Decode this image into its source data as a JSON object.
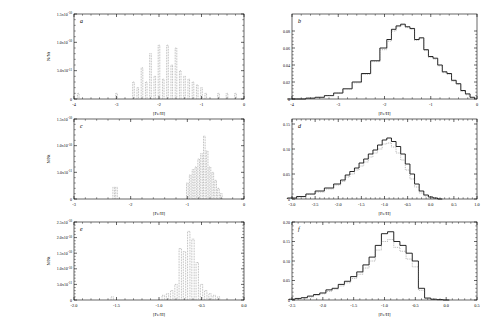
{
  "figure": {
    "background": "#ffffff",
    "axis_color": "#000000",
    "hist_color_solid": "#000000",
    "hist_color_dotted": "#666666",
    "panels": [
      "a",
      "b",
      "c",
      "d",
      "e",
      "f"
    ]
  },
  "chart_data": [
    {
      "type": "bar",
      "panel_label": "a",
      "title": "",
      "xlabel": "[Fe/H]",
      "ylabel": "N/Nt",
      "xlim": [
        -4,
        0
      ],
      "ylim": [
        0,
        1.5e-10
      ],
      "xticks": [
        -4,
        -3,
        -2,
        -1,
        0
      ],
      "xtick_labels": [
        "-4",
        "-3",
        "-2",
        "-1",
        "0"
      ],
      "yticks": [
        0,
        5e-11,
        1e-10,
        1.5e-10
      ],
      "ytick_labels": [
        "0",
        "5.0x10^-11",
        "1.0x10^-10",
        "1.5x10^-10"
      ],
      "grid": false,
      "legend": null,
      "linestyle": "dotted",
      "x": [
        -3.9,
        -3.0,
        -2.6,
        -2.5,
        -2.4,
        -2.3,
        -2.2,
        -2.1,
        -2.0,
        -1.9,
        -1.8,
        -1.7,
        -1.6,
        -1.5,
        -1.4,
        -1.3,
        -1.2,
        -1.1,
        -1.0,
        -0.9,
        -0.6,
        -0.4,
        -0.2
      ],
      "values": [
        1e-11,
        1e-11,
        3e-11,
        2e-11,
        5.5e-11,
        3e-11,
        8e-11,
        4e-11,
        9.5e-11,
        3.5e-11,
        9.5e-11,
        6e-11,
        9e-11,
        5e-11,
        4e-11,
        3.5e-11,
        3e-11,
        2.5e-11,
        2e-11,
        1e-11,
        1e-11,
        1e-11,
        1e-11
      ]
    },
    {
      "type": "line",
      "panel_label": "b",
      "title": "",
      "xlabel": "[Fe/H]",
      "ylabel": "",
      "xlim": [
        -4,
        0
      ],
      "ylim": [
        0,
        0.1
      ],
      "xticks": [
        -4,
        -3,
        -2,
        -1,
        0
      ],
      "xtick_labels": [
        "-4",
        "-3",
        "-2",
        "-1",
        "0"
      ],
      "yticks": [
        0,
        0.02,
        0.04,
        0.06,
        0.08
      ],
      "ytick_labels": [
        "0",
        "0.02",
        "0.04",
        "0.06",
        "0.08"
      ],
      "grid": false,
      "legend": null,
      "series": [
        {
          "name": "model",
          "linestyle": "solid",
          "x": [
            -4.0,
            -3.8,
            -3.6,
            -3.4,
            -3.2,
            -3.0,
            -2.8,
            -2.6,
            -2.4,
            -2.2,
            -2.0,
            -1.9,
            -1.8,
            -1.7,
            -1.6,
            -1.5,
            -1.4,
            -1.3,
            -1.2,
            -1.1,
            -1.0,
            -0.9,
            -0.8,
            -0.7,
            -0.6,
            -0.5,
            -0.4,
            -0.3,
            -0.2,
            -0.1
          ],
          "values": [
            0.0,
            0.0,
            0.001,
            0.002,
            0.004,
            0.007,
            0.012,
            0.02,
            0.03,
            0.045,
            0.06,
            0.07,
            0.082,
            0.086,
            0.088,
            0.085,
            0.083,
            0.07,
            0.072,
            0.058,
            0.05,
            0.048,
            0.04,
            0.032,
            0.03,
            0.022,
            0.018,
            0.01,
            0.006,
            0.002
          ]
        },
        {
          "name": "data",
          "linestyle": "dotted",
          "x": [
            -4.0,
            -3.8,
            -3.6,
            -3.4,
            -3.2,
            -3.0,
            -2.8,
            -2.6,
            -2.4,
            -2.2,
            -2.0,
            -1.9,
            -1.8,
            -1.7,
            -1.6,
            -1.5,
            -1.4,
            -1.3,
            -1.2,
            -1.1,
            -1.0,
            -0.9,
            -0.8,
            -0.7,
            -0.6,
            -0.5,
            -0.4,
            -0.3,
            -0.2,
            -0.1
          ],
          "values": [
            0.0,
            0.0,
            0.001,
            0.002,
            0.004,
            0.007,
            0.012,
            0.019,
            0.029,
            0.044,
            0.058,
            0.068,
            0.08,
            0.085,
            0.087,
            0.084,
            0.082,
            0.069,
            0.071,
            0.057,
            0.049,
            0.047,
            0.039,
            0.031,
            0.029,
            0.021,
            0.017,
            0.009,
            0.005,
            0.002
          ]
        }
      ]
    },
    {
      "type": "bar",
      "panel_label": "c",
      "title": "",
      "xlabel": "[Fe/H]",
      "ylabel": "N/Nt",
      "xlim": [
        -3,
        0
      ],
      "ylim": [
        0,
        1.5e-10
      ],
      "xticks": [
        -3,
        -2,
        -1,
        0
      ],
      "xtick_labels": [
        "-3",
        "-2",
        "-1",
        "0"
      ],
      "yticks": [
        0,
        5e-11,
        1e-10,
        1.5e-10
      ],
      "ytick_labels": [
        "0",
        "5.0x10^-11",
        "1.0x10^-10",
        "1.5x10^-10"
      ],
      "grid": false,
      "legend": null,
      "linestyle": "dotted",
      "x": [
        -2.3,
        -2.25,
        -1.0,
        -0.95,
        -0.9,
        -0.85,
        -0.8,
        -0.75,
        -0.7,
        -0.65,
        -0.6,
        -0.55,
        -0.5,
        -0.45,
        -0.4
      ],
      "values": [
        2.2e-11,
        2.2e-11,
        3e-11,
        4.5e-11,
        5.5e-11,
        6e-11,
        7.5e-11,
        8.5e-11,
        1.18e-10,
        9e-11,
        6e-11,
        5e-11,
        3.5e-11,
        2e-11,
        1e-11
      ]
    },
    {
      "type": "line",
      "panel_label": "d",
      "title": "",
      "xlabel": "[Fe/H]",
      "ylabel": "",
      "xlim": [
        -3.0,
        1.0
      ],
      "ylim": [
        0,
        0.16
      ],
      "xticks": [
        -3.0,
        -2.5,
        -2.0,
        -1.5,
        -1.0,
        -0.5,
        0.0,
        0.5,
        1.0
      ],
      "xtick_labels": [
        "-3.0",
        "-2.5",
        "-2.0",
        "-1.5",
        "-1.0",
        "-0.5",
        "0.0",
        "0.5",
        "1.0"
      ],
      "yticks": [
        0,
        0.05,
        0.1,
        0.15
      ],
      "ytick_labels": [
        "0",
        "0.05",
        "0.10",
        "0.15"
      ],
      "grid": false,
      "legend": null,
      "series": [
        {
          "name": "model",
          "linestyle": "solid",
          "x": [
            -3.0,
            -2.8,
            -2.6,
            -2.4,
            -2.2,
            -2.0,
            -1.9,
            -1.8,
            -1.7,
            -1.6,
            -1.5,
            -1.4,
            -1.3,
            -1.2,
            -1.1,
            -1.0,
            -0.9,
            -0.8,
            -0.7,
            -0.6,
            -0.5,
            -0.4,
            -0.3,
            -0.2,
            -0.1,
            0.0,
            0.1,
            0.2
          ],
          "values": [
            0.002,
            0.005,
            0.01,
            0.016,
            0.022,
            0.03,
            0.038,
            0.048,
            0.055,
            0.062,
            0.072,
            0.08,
            0.09,
            0.098,
            0.108,
            0.118,
            0.122,
            0.115,
            0.105,
            0.09,
            0.07,
            0.05,
            0.03,
            0.016,
            0.008,
            0.004,
            0.002,
            0.0
          ]
        },
        {
          "name": "data",
          "linestyle": "dotted",
          "x": [
            -3.0,
            -2.8,
            -2.6,
            -2.4,
            -2.2,
            -2.0,
            -1.9,
            -1.8,
            -1.7,
            -1.6,
            -1.5,
            -1.4,
            -1.3,
            -1.2,
            -1.1,
            -1.0,
            -0.9,
            -0.8,
            -0.7,
            -0.6,
            -0.5,
            -0.4,
            -0.3,
            -0.2,
            -0.1,
            0.0
          ],
          "values": [
            0.001,
            0.004,
            0.009,
            0.014,
            0.02,
            0.028,
            0.035,
            0.044,
            0.05,
            0.058,
            0.066,
            0.074,
            0.084,
            0.092,
            0.1,
            0.11,
            0.112,
            0.104,
            0.092,
            0.078,
            0.058,
            0.04,
            0.024,
            0.012,
            0.006,
            0.002
          ]
        }
      ]
    },
    {
      "type": "bar",
      "panel_label": "e",
      "title": "",
      "xlabel": "[Fe/H]",
      "ylabel": "N/Nt",
      "xlim": [
        -2.0,
        0.0
      ],
      "ylim": [
        0,
        2.5e-10
      ],
      "xticks": [
        -2.0,
        -1.5,
        -1.0,
        -0.5,
        0.0
      ],
      "xtick_labels": [
        "-2.0",
        "-1.5",
        "-1.0",
        "-0.5",
        "0.0"
      ],
      "yticks": [
        0,
        5e-11,
        1e-10,
        1.5e-10,
        2e-10,
        2.5e-10
      ],
      "ytick_labels": [
        "0",
        "5.0x10^-11",
        "1.0x10^-10",
        "1.5x10^-10",
        "2.0x10^-10",
        "2.5x10^-10"
      ],
      "grid": false,
      "legend": null,
      "linestyle": "dotted",
      "x": [
        -1.55,
        -0.95,
        -0.9,
        -0.85,
        -0.8,
        -0.75,
        -0.7,
        -0.65,
        -0.6,
        -0.55,
        -0.5,
        -0.45,
        -0.4,
        -0.35,
        -0.3
      ],
      "values": [
        1e-11,
        1.5e-11,
        2e-11,
        3e-11,
        5e-11,
        1.65e-10,
        1.55e-10,
        2.2e-10,
        1.95e-10,
        1.2e-10,
        5e-11,
        3e-11,
        2e-11,
        1.5e-11,
        1e-11
      ]
    },
    {
      "type": "line",
      "panel_label": "f",
      "title": "",
      "xlabel": "[Fe/H]",
      "ylabel": "",
      "xlim": [
        -2.5,
        0.5
      ],
      "ylim": [
        0,
        0.2
      ],
      "xticks": [
        -2.5,
        -2.0,
        -1.5,
        -1.0,
        -0.5,
        0.0,
        0.5
      ],
      "xtick_labels": [
        "-2.5",
        "-2.0",
        "-1.5",
        "-1.0",
        "-0.5",
        "0.0",
        "0.5"
      ],
      "yticks": [
        0,
        0.05,
        0.1,
        0.15,
        0.2
      ],
      "ytick_labels": [
        "0",
        "0.05",
        "0.10",
        "0.15",
        "0.20"
      ],
      "grid": false,
      "legend": null,
      "series": [
        {
          "name": "model",
          "linestyle": "solid",
          "x": [
            -2.5,
            -2.4,
            -2.3,
            -2.2,
            -2.1,
            -2.0,
            -1.9,
            -1.8,
            -1.7,
            -1.6,
            -1.5,
            -1.4,
            -1.3,
            -1.2,
            -1.1,
            -1.0,
            -0.9,
            -0.8,
            -0.7,
            -0.6,
            -0.5,
            -0.4,
            -0.3,
            -0.2,
            -0.1,
            0.0
          ],
          "values": [
            0.002,
            0.004,
            0.006,
            0.01,
            0.014,
            0.018,
            0.026,
            0.03,
            0.04,
            0.048,
            0.06,
            0.072,
            0.09,
            0.11,
            0.14,
            0.17,
            0.175,
            0.15,
            0.14,
            0.12,
            0.1,
            0.03,
            0.005,
            0.002,
            0.001,
            0.0
          ]
        },
        {
          "name": "data",
          "linestyle": "dotted",
          "x": [
            -2.5,
            -2.4,
            -2.3,
            -2.2,
            -2.1,
            -2.0,
            -1.9,
            -1.8,
            -1.7,
            -1.6,
            -1.5,
            -1.4,
            -1.3,
            -1.2,
            -1.1,
            -1.0,
            -0.9,
            -0.8,
            -0.7,
            -0.6,
            -0.5,
            -0.4,
            -0.3,
            -0.2,
            -0.1,
            0.0
          ],
          "values": [
            0.001,
            0.003,
            0.005,
            0.008,
            0.012,
            0.016,
            0.022,
            0.028,
            0.036,
            0.044,
            0.055,
            0.066,
            0.082,
            0.1,
            0.128,
            0.15,
            0.155,
            0.135,
            0.125,
            0.105,
            0.085,
            0.025,
            0.004,
            0.002,
            0.001,
            0.0
          ]
        }
      ]
    }
  ]
}
